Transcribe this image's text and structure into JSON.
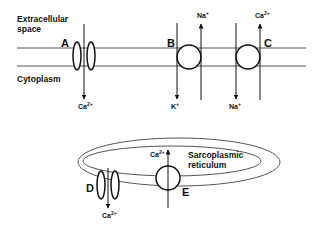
{
  "regions": {
    "extracellular_line1": "Extracellular",
    "extracellular_line2": "space",
    "cytoplasm": "Cytoplasm",
    "sr_line1": "Sarcoplasmic",
    "sr_line2": "reticulum"
  },
  "transporters": [
    {
      "id": "A",
      "type": "channel",
      "location": "plasma membrane",
      "ions": [
        {
          "ion": "Ca",
          "charge": "2+",
          "direction": "in"
        }
      ]
    },
    {
      "id": "B",
      "type": "pump",
      "location": "plasma membrane",
      "ions": [
        {
          "ion": "K",
          "charge": "+",
          "direction": "in"
        },
        {
          "ion": "Na",
          "charge": "+",
          "direction": "out"
        }
      ]
    },
    {
      "id": "C",
      "type": "exchanger",
      "location": "plasma membrane",
      "ions": [
        {
          "ion": "Na",
          "charge": "+",
          "direction": "in"
        },
        {
          "ion": "Ca",
          "charge": "2+",
          "direction": "out"
        }
      ]
    },
    {
      "id": "D",
      "type": "channel",
      "location": "sarcoplasmic reticulum",
      "ions": [
        {
          "ion": "Ca",
          "charge": "2+",
          "direction": "out of SR"
        }
      ]
    },
    {
      "id": "E",
      "type": "pump",
      "location": "sarcoplasmic reticulum",
      "ions": [
        {
          "ion": "Ca",
          "charge": "2+",
          "direction": "into SR"
        }
      ]
    }
  ],
  "labels": {
    "A": "A",
    "B": "B",
    "C": "C",
    "D": "D",
    "E": "E",
    "ca": "Ca",
    "ca_sup": "2+",
    "na": "Na",
    "na_sup": "+",
    "k": "K",
    "k_sup": "+"
  },
  "colors": {
    "line": "#444444",
    "outline": "#111111",
    "text": "#111111"
  }
}
